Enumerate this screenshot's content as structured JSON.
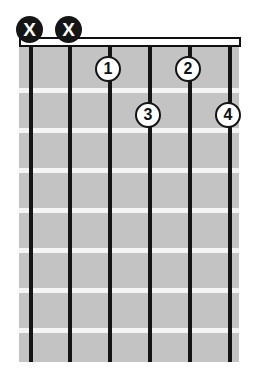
{
  "diagram": {
    "type": "guitar-chord-diagram",
    "orientation": "vertical",
    "string_count": 6,
    "fret_count": 8,
    "colors": {
      "fretboard": "#c3c3c3",
      "string": "#141414",
      "fret_line": "#f4f4f4",
      "nut_fill": "#ffffff",
      "nut_border": "#111111",
      "marker_fill": "#151515",
      "marker_text": "#ffffff",
      "dot_fill": "#ffffff",
      "dot_border": "#141414",
      "dot_text": "#111111",
      "background": "#ffffff"
    }
  },
  "strings": [
    {
      "index": 1,
      "x": 29
    },
    {
      "index": 2,
      "x": 68
    },
    {
      "index": 3,
      "x": 108
    },
    {
      "index": 4,
      "x": 148
    },
    {
      "index": 5,
      "x": 188
    },
    {
      "index": 6,
      "x": 228
    }
  ],
  "frets": [
    {
      "index": 1,
      "y": 88
    },
    {
      "index": 2,
      "y": 128
    },
    {
      "index": 3,
      "y": 168
    },
    {
      "index": 4,
      "y": 208
    },
    {
      "index": 5,
      "y": 248
    },
    {
      "index": 6,
      "y": 288
    },
    {
      "index": 7,
      "y": 328
    }
  ],
  "mute_markers": [
    {
      "label": "X",
      "string": 1,
      "x": 16,
      "y": 16
    },
    {
      "label": "X",
      "string": 2,
      "x": 55,
      "y": 16
    }
  ],
  "finger_dots": [
    {
      "label": "1",
      "string": 3,
      "fret": 1,
      "x": 95,
      "y": 56
    },
    {
      "label": "2",
      "string": 5,
      "fret": 1,
      "x": 175,
      "y": 56
    },
    {
      "label": "3",
      "string": 4,
      "fret": 2,
      "x": 135,
      "y": 102
    },
    {
      "label": "4",
      "string": 6,
      "fret": 2,
      "x": 215,
      "y": 102
    }
  ]
}
